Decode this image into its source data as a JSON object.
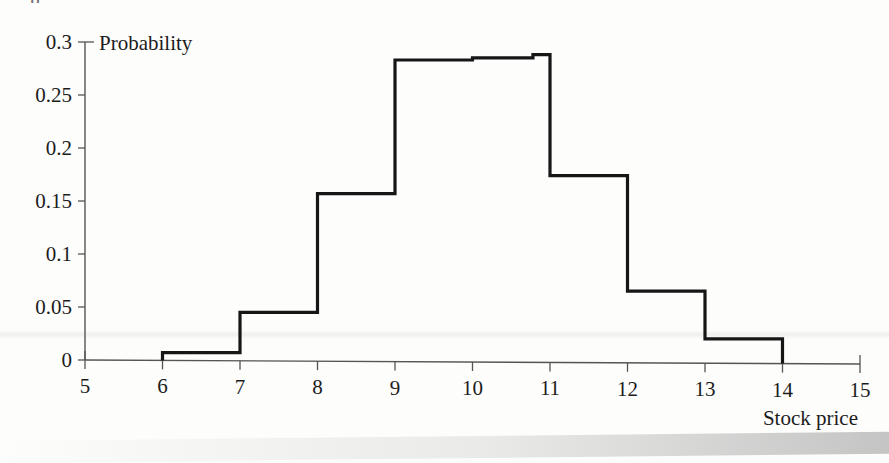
{
  "page": {
    "background_color": "#fdfdfc",
    "scan_artifact_top_text": "g"
  },
  "chart_data": {
    "type": "bar",
    "title": "",
    "subtitle": "",
    "xlabel": "Stock price",
    "ylabel": "Probability",
    "xlim": [
      5,
      15
    ],
    "ylim": [
      0,
      0.3
    ],
    "grid": false,
    "legend": null,
    "x_ticks": [
      5,
      6,
      7,
      8,
      9,
      10,
      11,
      12,
      13,
      14,
      15
    ],
    "x_tick_labels": [
      "5",
      "6",
      "7",
      "8",
      "9",
      "10",
      "11",
      "12",
      "13",
      "14",
      "15"
    ],
    "y_ticks": [
      0,
      0.05,
      0.1,
      0.15,
      0.2,
      0.25,
      0.3
    ],
    "y_tick_labels": [
      "0",
      "0.05",
      "0.1",
      "0.15",
      "0.2",
      "0.25",
      "0.3"
    ],
    "bin_edges": [
      5,
      6,
      7,
      8,
      9,
      10,
      11,
      12,
      13,
      14,
      15
    ],
    "categories": [
      "5-6",
      "6-7",
      "7-8",
      "8-9",
      "9-10",
      "10-11",
      "11-12",
      "12-13",
      "13-14",
      "14-15"
    ],
    "values": [
      0,
      0.007,
      0.045,
      0.157,
      0.283,
      0.288,
      0.174,
      0.065,
      0.02,
      0
    ],
    "peak_detail": {
      "note": "the 10-11 bin is drawn as two slightly different levels",
      "segments": [
        {
          "x_start": 10,
          "x_end": 10.78,
          "value": 0.285
        },
        {
          "x_start": 10.78,
          "x_end": 11,
          "value": 0.288
        }
      ]
    },
    "series": [
      {
        "name": "Probability",
        "values": [
          0,
          0.007,
          0.045,
          0.157,
          0.283,
          0.288,
          0.174,
          0.065,
          0.02,
          0
        ]
      }
    ]
  },
  "axes": {
    "y_axis": {
      "label": "Probability",
      "ticks": [
        {
          "value": "0.3",
          "v": 0.3
        },
        {
          "value": "0.25",
          "v": 0.25
        },
        {
          "value": "0.2",
          "v": 0.2
        },
        {
          "value": "0.15",
          "v": 0.15
        },
        {
          "value": "0.1",
          "v": 0.1
        },
        {
          "value": "0.05",
          "v": 0.05
        },
        {
          "value": "0",
          "v": 0
        }
      ]
    },
    "x_axis": {
      "label": "Stock price",
      "ticks": [
        {
          "value": "5",
          "v": 5
        },
        {
          "value": "6",
          "v": 6
        },
        {
          "value": "7",
          "v": 7
        },
        {
          "value": "8",
          "v": 8
        },
        {
          "value": "9",
          "v": 9
        },
        {
          "value": "10",
          "v": 10
        },
        {
          "value": "11",
          "v": 11
        },
        {
          "value": "12",
          "v": 12
        },
        {
          "value": "13",
          "v": 13
        },
        {
          "value": "14",
          "v": 14
        },
        {
          "value": "15",
          "v": 15
        }
      ]
    }
  },
  "style": {
    "line_color": "#161616",
    "axis_color": "#555555",
    "text_color": "#1c1c1c"
  }
}
